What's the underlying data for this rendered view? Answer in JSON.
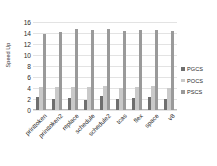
{
  "chart_data": {
    "type": "bar",
    "title": "",
    "xlabel": "",
    "ylabel": "Speed Up",
    "ylim": [
      0,
      16
    ],
    "yticks": [
      0,
      2,
      4,
      6,
      8,
      10,
      12,
      14,
      16
    ],
    "grid": true,
    "legend_position": "right",
    "categories": [
      "printtoken",
      "printtoken2",
      "replace",
      "schedule",
      "schedule2",
      "tcas",
      "flex",
      "space",
      "v8"
    ],
    "series": [
      {
        "name": "PGCS",
        "color": "#6f6f6f",
        "values": [
          2.4,
          2.0,
          2.2,
          1.9,
          2.5,
          2.0,
          2.1,
          2.4,
          2.0
        ]
      },
      {
        "name": "POCS",
        "color": "#c9c9c9",
        "values": [
          4.1,
          4.1,
          4.2,
          4.1,
          4.3,
          4.0,
          4.1,
          4.3,
          4.0
        ]
      },
      {
        "name": "PSCS",
        "color": "#9a9a9a",
        "values": [
          13.9,
          14.2,
          14.7,
          14.6,
          14.7,
          14.3,
          14.6,
          14.6,
          14.4
        ]
      }
    ]
  },
  "legend": {
    "items": [
      {
        "label": "PGCS",
        "color": "#6f6f6f"
      },
      {
        "label": "POCS",
        "color": "#c9c9c9"
      },
      {
        "label": "PSCS",
        "color": "#9a9a9a"
      }
    ]
  }
}
